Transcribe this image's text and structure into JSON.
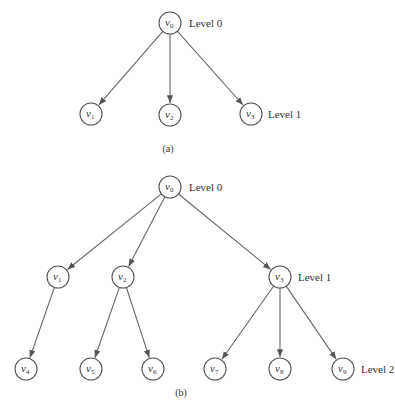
{
  "figures": [
    {
      "id": "a",
      "caption": "(a)",
      "caption_pos": [
        168,
        152
      ],
      "node_radius": 11,
      "nodes": [
        {
          "id": "v0",
          "letter": "v",
          "sub": "0",
          "x": 170,
          "y": 23
        },
        {
          "id": "v1",
          "letter": "v",
          "sub": "1",
          "x": 91,
          "y": 114
        },
        {
          "id": "v2",
          "letter": "v",
          "sub": "2",
          "x": 170,
          "y": 115
        },
        {
          "id": "v3",
          "letter": "v",
          "sub": "3",
          "x": 251,
          "y": 114
        }
      ],
      "edges": [
        [
          "v0",
          "v1"
        ],
        [
          "v0",
          "v2"
        ],
        [
          "v0",
          "v3"
        ]
      ],
      "levels": [
        {
          "label": "Level 0",
          "x": 189,
          "y": 27
        },
        {
          "label": "Level 1",
          "x": 268,
          "y": 118
        }
      ]
    },
    {
      "id": "b",
      "caption": "(b)",
      "caption_pos": [
        181,
        396
      ],
      "node_radius": 11,
      "nodes": [
        {
          "id": "v0",
          "letter": "v",
          "sub": "0",
          "x": 170,
          "y": 187
        },
        {
          "id": "v1",
          "letter": "v",
          "sub": "1",
          "x": 58,
          "y": 277
        },
        {
          "id": "v2",
          "letter": "v",
          "sub": "2",
          "x": 123,
          "y": 277
        },
        {
          "id": "v3",
          "letter": "v",
          "sub": "3",
          "x": 280,
          "y": 277
        },
        {
          "id": "v4",
          "letter": "v",
          "sub": "4",
          "x": 26,
          "y": 369
        },
        {
          "id": "v5",
          "letter": "v",
          "sub": "5",
          "x": 91,
          "y": 369
        },
        {
          "id": "v6",
          "letter": "v",
          "sub": "6",
          "x": 153,
          "y": 369
        },
        {
          "id": "v7",
          "letter": "v",
          "sub": "7",
          "x": 215,
          "y": 369
        },
        {
          "id": "v8",
          "letter": "v",
          "sub": "8",
          "x": 280,
          "y": 369
        },
        {
          "id": "v9",
          "letter": "v",
          "sub": "9",
          "x": 343,
          "y": 369
        }
      ],
      "edges": [
        [
          "v0",
          "v1"
        ],
        [
          "v0",
          "v2"
        ],
        [
          "v0",
          "v3"
        ],
        [
          "v1",
          "v4"
        ],
        [
          "v2",
          "v5"
        ],
        [
          "v2",
          "v6"
        ],
        [
          "v3",
          "v7"
        ],
        [
          "v3",
          "v8"
        ],
        [
          "v3",
          "v9"
        ]
      ],
      "levels": [
        {
          "label": "Level 0",
          "x": 189,
          "y": 191
        },
        {
          "label": "Level 1",
          "x": 298,
          "y": 281
        },
        {
          "label": "Level 2",
          "x": 361,
          "y": 373
        }
      ]
    }
  ]
}
